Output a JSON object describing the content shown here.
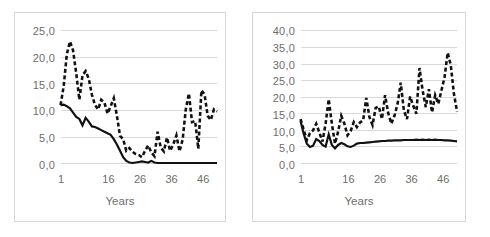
{
  "figure": {
    "background": "#ffffff",
    "border_color": "#d7d7d7",
    "gridline_color": "#d9d9d9",
    "series_color": "#111111",
    "tick_text_color": "#6d6d6d"
  },
  "chart_data": [
    {
      "type": "line",
      "id": "left-chart",
      "title": "",
      "xlabel": "Years",
      "ylabel": "",
      "grid": true,
      "legend": "none",
      "xlim": [
        1,
        51
      ],
      "ylim": [
        0,
        25
      ],
      "ytick_labels": [
        "0,0",
        "5,0",
        "10,0",
        "15,0",
        "20,0",
        "25,0"
      ],
      "ytick_values": [
        0,
        5,
        10,
        15,
        20,
        25
      ],
      "xtick_labels": [
        "1",
        "16",
        "26",
        "36",
        "46"
      ],
      "xtick_values": [
        1,
        16,
        26,
        36,
        46
      ],
      "x": [
        1,
        2,
        3,
        4,
        5,
        6,
        7,
        8,
        9,
        10,
        11,
        12,
        13,
        14,
        15,
        16,
        17,
        18,
        19,
        20,
        21,
        22,
        23,
        24,
        25,
        26,
        27,
        28,
        29,
        30,
        31,
        32,
        33,
        34,
        35,
        36,
        37,
        38,
        39,
        40,
        41,
        42,
        43,
        44,
        45,
        46,
        47,
        48,
        49,
        50,
        51
      ],
      "series": [
        {
          "name": "solid-series",
          "style": "solid",
          "values": [
            11.0,
            11.1,
            10.8,
            10.4,
            9.6,
            8.8,
            8.4,
            7.2,
            8.6,
            7.9,
            7.0,
            6.9,
            6.6,
            6.3,
            6.0,
            5.7,
            5.4,
            4.6,
            3.6,
            2.4,
            1.2,
            0.5,
            0.2,
            0.1,
            0.2,
            0.3,
            0.4,
            0.3,
            0.2,
            0.5,
            0.2,
            0.1,
            0.1,
            0.1,
            0.1,
            0.1,
            0.1,
            0.1,
            0.1,
            0.1,
            0.1,
            0.1,
            0.1,
            0.1,
            0.1,
            0.1,
            0.1,
            0.1,
            0.1,
            0.1,
            0.1
          ]
        },
        {
          "name": "dashed-series",
          "style": "dashed",
          "values": [
            11.0,
            14.6,
            20.6,
            23.0,
            21.3,
            17.0,
            12.0,
            16.6,
            17.4,
            16.0,
            13.0,
            11.0,
            10.2,
            12.0,
            11.5,
            9.4,
            10.8,
            12.3,
            9.0,
            5.2,
            4.6,
            2.4,
            2.9,
            2.2,
            1.8,
            1.6,
            1.2,
            2.4,
            3.4,
            2.1,
            1.4,
            6.0,
            3.0,
            2.3,
            4.9,
            2.4,
            3.6,
            5.3,
            2.3,
            4.5,
            10.2,
            13.2,
            7.8,
            8.0,
            2.8,
            13.8,
            13.0,
            9.0,
            8.2,
            10.2,
            9.8
          ]
        }
      ]
    },
    {
      "type": "line",
      "id": "right-chart",
      "title": "",
      "xlabel": "Years",
      "ylabel": "",
      "grid": true,
      "legend": "none",
      "xlim": [
        1,
        51
      ],
      "ylim": [
        0,
        40
      ],
      "ytick_labels": [
        "0,0",
        "5,0",
        "10,0",
        "15,0",
        "20,0",
        "25,0",
        "30,0",
        "35,0",
        "40,0"
      ],
      "ytick_values": [
        0,
        5,
        10,
        15,
        20,
        25,
        30,
        35,
        40
      ],
      "xtick_labels": [
        "1",
        "16",
        "26",
        "36",
        "46"
      ],
      "xtick_values": [
        1,
        16,
        26,
        36,
        46
      ],
      "x": [
        1,
        2,
        3,
        4,
        5,
        6,
        7,
        8,
        9,
        10,
        11,
        12,
        13,
        14,
        15,
        16,
        17,
        18,
        19,
        20,
        21,
        22,
        23,
        24,
        25,
        26,
        27,
        28,
        29,
        30,
        31,
        32,
        33,
        34,
        35,
        36,
        37,
        38,
        39,
        40,
        41,
        42,
        43,
        44,
        45,
        46,
        47,
        48,
        49,
        50,
        51
      ],
      "series": [
        {
          "name": "solid-series",
          "style": "solid",
          "values": [
            12.8,
            9.0,
            6.0,
            5.0,
            5.4,
            7.4,
            6.8,
            5.6,
            5.1,
            8.8,
            5.6,
            4.6,
            5.6,
            6.2,
            5.8,
            5.2,
            5.0,
            5.4,
            6.0,
            6.2,
            6.2,
            6.3,
            6.4,
            6.5,
            6.6,
            6.7,
            6.8,
            6.8,
            6.9,
            6.9,
            7.0,
            7.0,
            7.0,
            7.1,
            7.1,
            7.1,
            7.1,
            7.2,
            7.1,
            7.2,
            7.1,
            7.2,
            7.1,
            7.2,
            7.1,
            7.1,
            7.0,
            7.0,
            6.9,
            6.8,
            6.7
          ]
        },
        {
          "name": "dashed-series",
          "style": "dashed",
          "values": [
            13.4,
            10.2,
            7.0,
            9.2,
            10.0,
            12.0,
            9.4,
            6.6,
            12.0,
            19.4,
            12.0,
            6.0,
            9.6,
            14.4,
            12.0,
            8.5,
            9.8,
            12.5,
            11.0,
            12.4,
            13.0,
            19.8,
            14.0,
            11.6,
            16.8,
            17.2,
            13.4,
            20.6,
            15.2,
            12.0,
            14.4,
            18.0,
            24.4,
            16.0,
            13.4,
            20.2,
            17.4,
            15.0,
            28.8,
            22.0,
            17.0,
            22.4,
            15.4,
            20.6,
            18.0,
            22.0,
            26.0,
            33.4,
            29.6,
            21.0,
            15.6
          ]
        }
      ]
    }
  ]
}
